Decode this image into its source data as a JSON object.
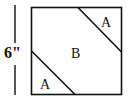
{
  "diagram": {
    "dimension_label": "6\"",
    "regions": [
      {
        "id": "A-top",
        "label": "A"
      },
      {
        "id": "B-center",
        "label": "B"
      },
      {
        "id": "A-bottom",
        "label": "A"
      }
    ],
    "colors": {
      "stroke": "#111111",
      "background": "#ffffff"
    }
  }
}
